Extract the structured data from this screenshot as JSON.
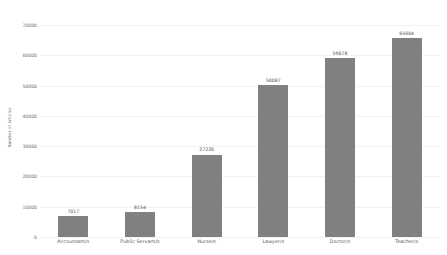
{
  "chart_data": {
    "type": "bar",
    "title": "",
    "xlabel": "",
    "ylabel": "Number of Articles",
    "categories": [
      "Accountant/s",
      "Public Servant/s",
      "Nurse/s",
      "Lawyer/s",
      "Doctor/s",
      "Teacher/s"
    ],
    "values": [
      7017,
      8154,
      27220,
      50087,
      59078,
      65604
    ],
    "value_labels": [
      "7017",
      "8154",
      "27220",
      "50087",
      "59078",
      "65604"
    ],
    "ylim": [
      0,
      70000
    ],
    "ytick_values": [
      0,
      10000,
      20000,
      30000,
      40000,
      50000,
      60000,
      70000
    ],
    "ytick_labels": [
      "0",
      "10000",
      "20000",
      "30000",
      "40000",
      "50000",
      "60000",
      "70000"
    ],
    "grid": true,
    "legend": false,
    "bar_color": "#808080",
    "background_color": "#ffffff",
    "gridline_color": "#f2f2f2"
  }
}
